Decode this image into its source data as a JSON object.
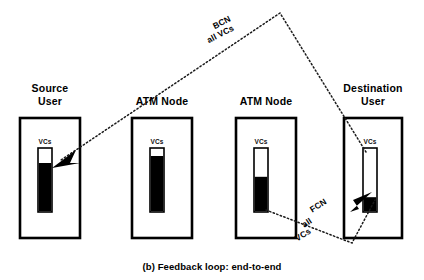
{
  "figure": {
    "caption": "(b) Feedback loop: end-to-end",
    "background_color": "#ffffff",
    "ink_color": "#000000"
  },
  "nodes": [
    {
      "id": "source-user",
      "title": "Source\nUser",
      "gauge_label": "VCs",
      "fill_percent": 77,
      "box": {
        "x": 20,
        "y": 118,
        "w": 60,
        "h": 120
      },
      "gauge": {
        "x": 38,
        "y": 148,
        "w": 14,
        "h": 64
      },
      "title_pos": {
        "x": 20,
        "y": 82
      }
    },
    {
      "id": "atm-node-1",
      "title": "ATM Node",
      "gauge_label": "VCs",
      "fill_percent": 88,
      "box": {
        "x": 132,
        "y": 118,
        "w": 60,
        "h": 120
      },
      "gauge": {
        "x": 150,
        "y": 148,
        "w": 14,
        "h": 64
      },
      "title_pos": {
        "x": 127,
        "y": 95
      }
    },
    {
      "id": "atm-node-2",
      "title": "ATM Node",
      "gauge_label": "VCs",
      "fill_percent": 55,
      "box": {
        "x": 236,
        "y": 118,
        "w": 60,
        "h": 120
      },
      "gauge": {
        "x": 254,
        "y": 148,
        "w": 14,
        "h": 64
      },
      "title_pos": {
        "x": 231,
        "y": 95
      }
    },
    {
      "id": "destination-user",
      "title": "Destination\nUser",
      "gauge_label": "VCs",
      "fill_percent": 22,
      "box": {
        "x": 344,
        "y": 118,
        "w": 58,
        "h": 120
      },
      "gauge": {
        "x": 363,
        "y": 148,
        "w": 14,
        "h": 64
      },
      "title_pos": {
        "x": 338,
        "y": 82
      }
    }
  ],
  "flows": [
    {
      "id": "bcn-flow",
      "lines": [
        "BCN",
        "all VCs"
      ],
      "direction": "destination-to-source",
      "style": "dotted",
      "label_pos": {
        "x": 211,
        "y": 20
      },
      "label_rotation": -27
    },
    {
      "id": "fcn-flow",
      "lines": [
        "FCN",
        "all",
        "VCs"
      ],
      "direction": "node-to-destination",
      "style": "dotted",
      "label_pos": {
        "x": 307,
        "y": 205
      },
      "label_rotation": -33
    }
  ],
  "icons": {
    "arrow_source": "arrowhead-left-icon",
    "arrow_destination": "arrowhead-right-icon"
  }
}
